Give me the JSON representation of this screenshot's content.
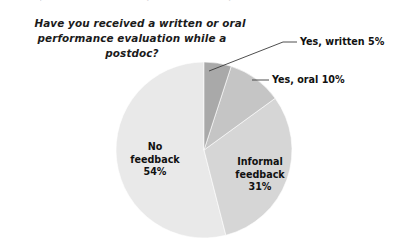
{
  "figure": {
    "clipped_top_line": "professional development while a postdoc?",
    "title_line_1": "Have you received a written or oral",
    "title_line_2": "performance evaluation while a postdoc?"
  },
  "labels": {
    "no_feedback": {
      "line1": "No",
      "line2": "feedback",
      "line3": "54%"
    },
    "informal": {
      "line1": "Informal",
      "line2": "feedback",
      "line3": "31%"
    },
    "yes_written": "Yes, written 5%",
    "yes_oral": "Yes, oral 10%"
  },
  "colors": {
    "yes_written": "#a9a9a9",
    "yes_oral": "#c5c5c5",
    "informal_feedback": "#d6d6d6",
    "no_feedback": "#e9e9e9",
    "leader_line": "#3a3a3a",
    "background": "#ffffff",
    "text": "#111111"
  },
  "chart_data": {
    "type": "pie",
    "title": "Have you received a written or oral performance evaluation while a postdoc?",
    "xlabel": "",
    "ylabel": "",
    "units": "percent",
    "start_angle_deg": 0,
    "direction": "clockwise",
    "legend": "none (direct labels)",
    "grid": false,
    "categories": [
      "Yes, written",
      "Yes, oral",
      "Informal feedback",
      "No feedback"
    ],
    "values": [
      5,
      10,
      31,
      54
    ],
    "slices": [
      {
        "label": "Yes, written",
        "value": 5,
        "display": "Yes, written 5%",
        "color": "#a9a9a9",
        "label_placement": "callout-right"
      },
      {
        "label": "Yes, oral",
        "value": 10,
        "display": "Yes, oral 10%",
        "color": "#c5c5c5",
        "label_placement": "callout-right"
      },
      {
        "label": "Informal feedback",
        "value": 31,
        "display": "Informal feedback 31%",
        "color": "#d6d6d6",
        "label_placement": "inside"
      },
      {
        "label": "No feedback",
        "value": 54,
        "display": "No feedback 54%",
        "color": "#e9e9e9",
        "label_placement": "inside"
      }
    ],
    "total": 100
  },
  "geometry": {
    "center_x": 204,
    "center_y": 150,
    "radius": 88
  }
}
